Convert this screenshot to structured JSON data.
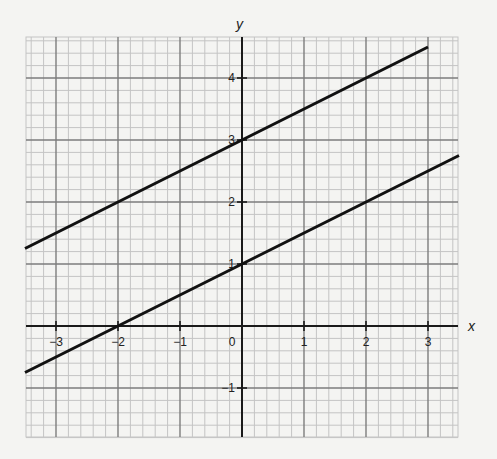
{
  "chart_data": {
    "type": "line",
    "title": "",
    "xlabel": "x",
    "ylabel": "y",
    "xlim": [
      -3.5,
      3.5
    ],
    "ylim": [
      -1.8,
      4.6
    ],
    "grid": true,
    "minor_grid_step": 0.2,
    "major_grid_step": 1,
    "x_ticks": [
      -3,
      -2,
      -1,
      0,
      1,
      2,
      3
    ],
    "y_ticks": [
      -1,
      1,
      2,
      3,
      4
    ],
    "x_tick_labels": [
      "−3",
      "−2",
      "−1",
      "0",
      "1",
      "2",
      "3"
    ],
    "y_tick_labels": [
      "−1",
      "1",
      "2",
      "3",
      "4"
    ],
    "series": [
      {
        "name": "line-upper",
        "equation": "y = 0.5x + 3",
        "slope": 0.5,
        "intercept": 3,
        "x": [
          -3.5,
          3.0
        ],
        "y": [
          1.25,
          4.5
        ],
        "color": "#111111"
      },
      {
        "name": "line-lower",
        "equation": "y = 0.5x + 1",
        "slope": 0.5,
        "intercept": 1,
        "x": [
          -3.5,
          3.5
        ],
        "y": [
          -0.75,
          2.75
        ],
        "color": "#111111"
      }
    ]
  },
  "labels": {
    "x_axis": "x",
    "y_axis": "y",
    "origin": "0"
  },
  "colors": {
    "background": "#f4f4f2",
    "minor_grid": "#c4c4c4",
    "major_grid": "#7d7d7d",
    "axis": "#1a1a1a",
    "line": "#111111"
  }
}
